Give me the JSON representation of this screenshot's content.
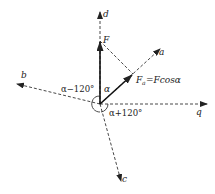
{
  "diagram": {
    "type": "vector-projection",
    "origin": {
      "x": 100,
      "y": 104
    },
    "axes": [
      {
        "name": "d",
        "label": "d",
        "tip": {
          "x": 100,
          "y": 12
        },
        "style": "dashed"
      },
      {
        "name": "a",
        "label": "a",
        "tip": {
          "x": 160,
          "y": 49
        },
        "style": "dashed"
      },
      {
        "name": "q",
        "label": "q",
        "tip": {
          "x": 207,
          "y": 104
        },
        "style": "dashed"
      },
      {
        "name": "b",
        "label": "b",
        "tip": {
          "x": 17,
          "y": 84
        },
        "style": "dashed"
      },
      {
        "name": "c",
        "label": "c",
        "tip": {
          "x": 121,
          "y": 181
        },
        "style": "dashed"
      }
    ],
    "vectors": [
      {
        "name": "F",
        "label": "F",
        "tip": {
          "x": 100,
          "y": 41
        }
      },
      {
        "name": "Fa",
        "label": "F",
        "subscript": "a",
        "equation": "=Fcosα",
        "tip": {
          "x": 133,
          "y": 74
        }
      }
    ],
    "projection_line": {
      "from": {
        "x": 100,
        "y": 41
      },
      "to": {
        "x": 133,
        "y": 74
      }
    },
    "angle_labels": {
      "alpha": "α",
      "alpha_minus_120": "α−120°",
      "alpha_plus_120": "α+120°"
    },
    "colors": {
      "stroke": "#222222",
      "background": "#ffffff"
    }
  }
}
